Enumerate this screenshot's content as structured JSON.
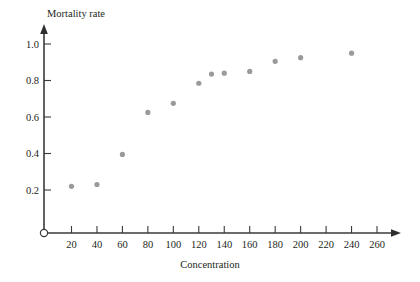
{
  "chart_data": {
    "type": "scatter",
    "title": "",
    "xlabel": "Concentration",
    "ylabel": "Mortality rate",
    "xlim": [
      0,
      270
    ],
    "ylim": [
      0,
      1.06
    ],
    "grid": false,
    "legend": "none",
    "x_ticks": [
      20,
      40,
      60,
      80,
      100,
      120,
      140,
      160,
      180,
      200,
      220,
      240,
      260
    ],
    "y_ticks": [
      0.2,
      0.4,
      0.6,
      0.8,
      1.0
    ],
    "x_tick_labels": [
      "20",
      "40",
      "60",
      "80",
      "100",
      "120",
      "140",
      "160",
      "180",
      "200",
      "220",
      "240",
      "260"
    ],
    "y_tick_labels": [
      "0.2",
      "0.4",
      "0.6",
      "0.8",
      "1.0"
    ],
    "marker": {
      "shape": "circle",
      "color": "#9a9a9c",
      "radius": 2.6
    },
    "x": [
      20,
      40,
      60,
      80,
      100,
      120,
      130,
      140,
      160,
      180,
      200,
      240
    ],
    "y": [
      0.22,
      0.23,
      0.395,
      0.625,
      0.675,
      0.785,
      0.835,
      0.84,
      0.85,
      0.905,
      0.925,
      0.95
    ],
    "points": [
      {
        "x": 20,
        "y": 0.22
      },
      {
        "x": 40,
        "y": 0.23
      },
      {
        "x": 60,
        "y": 0.395
      },
      {
        "x": 80,
        "y": 0.625
      },
      {
        "x": 100,
        "y": 0.675
      },
      {
        "x": 120,
        "y": 0.785
      },
      {
        "x": 130,
        "y": 0.835
      },
      {
        "x": 140,
        "y": 0.84
      },
      {
        "x": 160,
        "y": 0.85
      },
      {
        "x": 180,
        "y": 0.905
      },
      {
        "x": 200,
        "y": 0.925
      },
      {
        "x": 240,
        "y": 0.95
      }
    ]
  },
  "axes": {
    "y_axis_title": "Mortality rate",
    "x_axis_title": "Concentration",
    "origin_marker": "open-circle"
  }
}
